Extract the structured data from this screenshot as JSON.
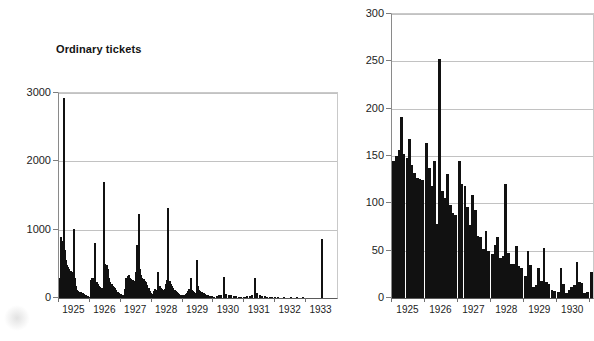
{
  "figure": {
    "background": "#ffffff",
    "ink_color": "#111111",
    "grid_color": "#c2c2c2"
  },
  "chart_data": [
    {
      "id": "ordinary-tickets",
      "type": "bar",
      "title": "Ordinary tickets",
      "xlabel": "",
      "ylabel": "",
      "ylim": [
        0,
        3000
      ],
      "yticks": [
        0,
        1000,
        2000,
        3000
      ],
      "ytick_labels": [
        "0",
        "1000",
        "2000",
        "3000"
      ],
      "xtick_labels": [
        "1925",
        "1926",
        "1927",
        "1928",
        "1929",
        "1930",
        "1931",
        "1932",
        "1933"
      ],
      "grid": true,
      "legend": "none",
      "bin_note": "weekly counts grouped by year",
      "x": [
        1925.02,
        1925.04,
        1925.06,
        1925.08,
        1925.1,
        1925.12,
        1925.14,
        1925.16,
        1925.18,
        1925.2,
        1925.22,
        1925.24,
        1925.26,
        1925.28,
        1925.3,
        1925.32,
        1925.34,
        1925.36,
        1925.38,
        1925.4,
        1925.42,
        1925.44,
        1925.46,
        1925.48,
        1925.5,
        1925.52,
        1925.54,
        1925.56,
        1925.58,
        1925.6,
        1925.62,
        1925.64,
        1925.66,
        1925.68,
        1925.7,
        1925.72,
        1925.74,
        1925.76,
        1925.78,
        1925.8,
        1925.82,
        1925.84,
        1925.86,
        1925.88,
        1925.9,
        1925.92,
        1925.94,
        1925.96,
        1925.98,
        1926.02,
        1926.06,
        1926.1,
        1926.14,
        1926.18,
        1926.22,
        1926.26,
        1926.3,
        1926.34,
        1926.38,
        1926.42,
        1926.46,
        1926.5,
        1926.54,
        1926.58,
        1926.62,
        1926.66,
        1926.7,
        1926.74,
        1926.78,
        1926.82,
        1926.86,
        1926.9,
        1926.94,
        1926.98,
        1927.02,
        1927.06,
        1927.1,
        1927.14,
        1927.18,
        1927.22,
        1927.26,
        1927.3,
        1927.34,
        1927.38,
        1927.42,
        1927.46,
        1927.5,
        1927.54,
        1927.58,
        1927.62,
        1927.66,
        1927.7,
        1927.74,
        1927.78,
        1927.82,
        1927.86,
        1927.9,
        1927.94,
        1927.98,
        1928.02,
        1928.06,
        1928.1,
        1928.14,
        1928.18,
        1928.22,
        1928.26,
        1928.3,
        1928.34,
        1928.38,
        1928.42,
        1928.46,
        1928.5,
        1928.54,
        1928.58,
        1928.62,
        1928.66,
        1928.7,
        1928.74,
        1928.78,
        1928.82,
        1928.86,
        1928.9,
        1928.94,
        1928.98,
        1929.02,
        1929.06,
        1929.1,
        1929.14,
        1929.18,
        1929.22,
        1929.26,
        1929.3,
        1929.34,
        1929.38,
        1929.42,
        1929.46,
        1929.5,
        1929.54,
        1929.58,
        1929.62,
        1929.66,
        1929.7,
        1929.74,
        1929.78,
        1929.82,
        1929.86,
        1929.9,
        1929.94,
        1929.98,
        1930.02,
        1930.1,
        1930.18,
        1930.26,
        1930.34,
        1930.42,
        1930.5,
        1930.58,
        1930.66,
        1930.74,
        1930.82,
        1930.9,
        1930.98,
        1931.02,
        1931.1,
        1931.18,
        1931.26,
        1931.34,
        1931.42,
        1931.5,
        1931.58,
        1931.66,
        1931.74,
        1931.82,
        1931.9,
        1931.98,
        1932.1,
        1932.3,
        1932.5,
        1932.7,
        1932.9,
        1933.5
      ],
      "values": [
        120,
        300,
        880,
        900,
        840,
        760,
        640,
        2930,
        700,
        640,
        560,
        520,
        480,
        460,
        440,
        430,
        400,
        390,
        390,
        380,
        380,
        380,
        120,
        60,
        1010,
        300,
        180,
        120,
        110,
        100,
        100,
        95,
        90,
        90,
        85,
        80,
        80,
        75,
        70,
        60,
        55,
        50,
        45,
        40,
        35,
        30,
        25,
        20,
        20,
        260,
        290,
        300,
        250,
        810,
        240,
        200,
        180,
        160,
        150,
        140,
        1700,
        500,
        480,
        420,
        300,
        230,
        200,
        180,
        160,
        140,
        110,
        90,
        70,
        50,
        60,
        50,
        45,
        130,
        300,
        320,
        340,
        300,
        280,
        260,
        240,
        250,
        380,
        780,
        1230,
        420,
        330,
        300,
        280,
        250,
        230,
        190,
        140,
        100,
        70,
        60,
        100,
        130,
        110,
        100,
        380,
        170,
        140,
        130,
        120,
        130,
        200,
        260,
        1310,
        250,
        200,
        170,
        150,
        120,
        100,
        90,
        70,
        60,
        50,
        40,
        30,
        40,
        60,
        80,
        100,
        130,
        300,
        120,
        100,
        90,
        80,
        560,
        180,
        110,
        100,
        90,
        80,
        70,
        60,
        50,
        40,
        35,
        30,
        25,
        20,
        20,
        30,
        40,
        50,
        310,
        60,
        50,
        40,
        30,
        25,
        20,
        18,
        15,
        20,
        25,
        30,
        40,
        290,
        70,
        40,
        30,
        25,
        20,
        18,
        15,
        12,
        10,
        8,
        8,
        6,
        5,
        870
      ]
    },
    {
      "id": "right-panel",
      "type": "bar",
      "title": "",
      "xlabel": "",
      "ylabel": "",
      "ylim": [
        0,
        300
      ],
      "yticks": [
        0,
        50,
        100,
        150,
        200,
        250,
        300
      ],
      "ytick_labels": [
        "0",
        "50",
        "100",
        "150",
        "200",
        "250",
        "300"
      ],
      "xtick_labels": [
        "1925",
        "1926",
        "1927",
        "1928",
        "1929",
        "1930",
        "1"
      ],
      "grid": true,
      "legend": "none",
      "bin_note": "weekly counts grouped by year",
      "x": [
        1925.05,
        1925.13,
        1925.21,
        1925.29,
        1925.37,
        1925.45,
        1925.53,
        1925.61,
        1925.69,
        1925.77,
        1925.85,
        1925.93,
        1926.05,
        1926.13,
        1926.21,
        1926.29,
        1926.37,
        1926.45,
        1926.53,
        1926.61,
        1926.69,
        1926.77,
        1926.85,
        1926.93,
        1927.05,
        1927.13,
        1927.21,
        1927.29,
        1927.37,
        1927.45,
        1927.53,
        1927.61,
        1927.69,
        1927.77,
        1927.85,
        1927.93,
        1928.05,
        1928.13,
        1928.21,
        1928.29,
        1928.37,
        1928.45,
        1928.53,
        1928.61,
        1928.69,
        1928.77,
        1928.85,
        1928.93,
        1929.05,
        1929.13,
        1929.21,
        1929.29,
        1929.37,
        1929.45,
        1929.53,
        1929.61,
        1929.69,
        1929.77,
        1929.85,
        1929.93,
        1930.05,
        1930.13,
        1930.21,
        1930.29,
        1930.37,
        1930.45,
        1930.53,
        1930.61,
        1930.69,
        1930.77,
        1930.85,
        1930.93,
        1931.05
      ],
      "values": [
        145,
        150,
        156,
        191,
        152,
        148,
        168,
        140,
        132,
        127,
        126,
        125,
        164,
        137,
        118,
        145,
        78,
        253,
        113,
        106,
        131,
        98,
        90,
        88,
        145,
        120,
        118,
        96,
        77,
        109,
        93,
        66,
        64,
        52,
        71,
        50,
        46,
        56,
        64,
        42,
        44,
        120,
        48,
        36,
        36,
        55,
        34,
        32,
        23,
        50,
        35,
        12,
        14,
        32,
        18,
        53,
        17,
        15,
        8,
        7,
        6,
        32,
        15,
        5,
        8,
        12,
        14,
        38,
        17,
        16,
        5,
        6,
        28
      ]
    }
  ]
}
